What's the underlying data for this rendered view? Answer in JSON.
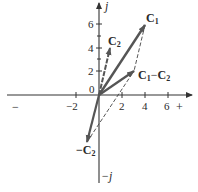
{
  "diagram": {
    "axes": {
      "positive_real_label": "+",
      "negative_real_label": "−",
      "positive_imag_label": "j",
      "negative_imag_label": "−j",
      "x_ticks": [
        "−2",
        "2",
        "4",
        "6"
      ],
      "y_ticks": [
        "0",
        "2",
        "4",
        "6"
      ]
    },
    "vectors": [
      {
        "name": "C1",
        "label": "C",
        "sub": "1",
        "x": 4,
        "y": 6
      },
      {
        "name": "C2",
        "label": "C",
        "sub": "2",
        "x": 1,
        "y": 4
      },
      {
        "name": "-C2",
        "label": "−C",
        "sub": "2",
        "x": -1,
        "y": -4
      },
      {
        "name": "C1-C2",
        "label_a": "C",
        "sub_a": "1",
        "op": "−",
        "label_b": "C",
        "sub_b": "2",
        "x": 3,
        "y": 2
      }
    ],
    "colors": {
      "line": "#3a3a3a",
      "vector": "#555555"
    }
  }
}
